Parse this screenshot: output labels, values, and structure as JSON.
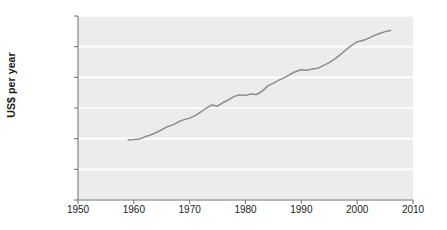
{
  "chart_data": {
    "type": "line",
    "title": "",
    "subtitle": "",
    "xlabel": "",
    "ylabel": "US$ per year",
    "xlim": [
      1950,
      2010
    ],
    "ylim": [
      0,
      30000
    ],
    "grid": true,
    "legend": "none",
    "x_ticks": [
      1950,
      1960,
      1970,
      1980,
      1990,
      2000,
      2010
    ],
    "x_tick_labels": [
      "1950",
      "1960",
      "1970",
      "1980",
      "1990",
      "2000",
      "2010"
    ],
    "y_ticks": [
      0,
      5000,
      10000,
      15000,
      20000,
      25000,
      30000
    ],
    "y_tick_labels": [
      "0",
      "5 000",
      "10 000",
      "15 000",
      "20 000",
      "25 000",
      "30 000"
    ],
    "series": [
      {
        "name": "US$ per year",
        "color": "#8c8c8c",
        "x": [
          1959,
          1960,
          1961,
          1962,
          1963,
          1964,
          1965,
          1966,
          1967,
          1968,
          1969,
          1970,
          1971,
          1972,
          1973,
          1974,
          1975,
          1976,
          1977,
          1978,
          1979,
          1980,
          1981,
          1982,
          1983,
          1984,
          1985,
          1986,
          1987,
          1988,
          1989,
          1990,
          1991,
          1992,
          1993,
          1994,
          1995,
          1996,
          1997,
          1998,
          1999,
          2000,
          2001,
          2002,
          2003,
          2004,
          2005,
          2006
        ],
        "values": [
          9800,
          9850,
          9950,
          10300,
          10600,
          11000,
          11450,
          11950,
          12250,
          12750,
          13100,
          13350,
          13750,
          14350,
          15000,
          15500,
          15300,
          15900,
          16350,
          16900,
          17150,
          17050,
          17300,
          17200,
          17750,
          18600,
          19050,
          19550,
          19950,
          20500,
          20950,
          21250,
          21150,
          21350,
          21500,
          21950,
          22400,
          23000,
          23700,
          24500,
          25200,
          25800,
          26000,
          26350,
          26800,
          27150,
          27450,
          27650
        ]
      }
    ]
  },
  "axes": {
    "y_axis_title": "US$ per year"
  },
  "colors": {
    "plot_background": "#ececec",
    "gridline": "#ffffff",
    "line": "#8c8c8c",
    "axis": "#6e6e6e",
    "text": "#1a1a1a"
  }
}
